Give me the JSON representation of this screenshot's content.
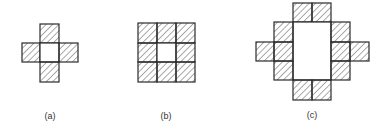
{
  "figures": [
    {
      "id": "a",
      "label": "(a)",
      "description": "Plus-shaped arrangement of four hatched squares around an empty center square",
      "cell_size": 19,
      "hatched_cells": [
        [
          1,
          0
        ],
        [
          0,
          1
        ],
        [
          2,
          1
        ],
        [
          1,
          2
        ]
      ],
      "empty_cells": [
        [
          1,
          1
        ]
      ]
    },
    {
      "id": "b",
      "label": "(b)",
      "description": "3x3 grid of hatched squares with empty center square",
      "cell_size": 19,
      "hatched_cells": [
        [
          0,
          0
        ],
        [
          1,
          0
        ],
        [
          2,
          0
        ],
        [
          0,
          1
        ],
        [
          2,
          1
        ],
        [
          0,
          2
        ],
        [
          1,
          2
        ],
        [
          2,
          2
        ]
      ],
      "empty_cells": [
        [
          1,
          1
        ]
      ]
    },
    {
      "id": "c",
      "label": "(c)",
      "description": "Twelve hatched squares surrounding an empty 2x3 rectangular region",
      "cell_size": 19,
      "hatched_cells": [
        [
          2,
          0
        ],
        [
          3,
          0
        ],
        [
          1,
          1
        ],
        [
          4,
          1
        ],
        [
          0,
          2
        ],
        [
          1,
          2
        ],
        [
          4,
          2
        ],
        [
          5,
          2
        ],
        [
          1,
          3
        ],
        [
          4,
          3
        ],
        [
          2,
          4
        ],
        [
          3,
          4
        ]
      ],
      "empty_region": {
        "cols": 2,
        "rows": 3
      }
    }
  ],
  "colors": {
    "stroke": "#2a2a2a",
    "hatch": "#555555",
    "background": "#ffffff"
  }
}
